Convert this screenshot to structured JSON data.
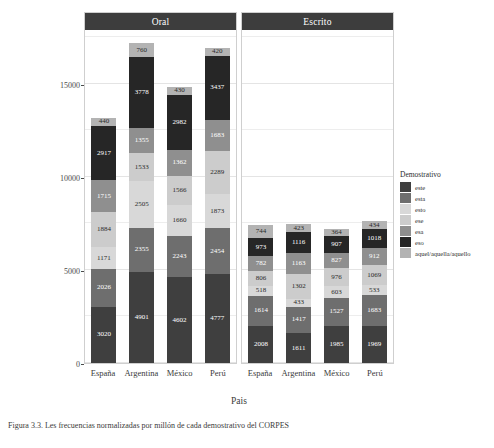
{
  "chart_data": {
    "type": "bar",
    "subtype": "stacked",
    "title": "",
    "xlabel": "Pais",
    "ylabel": "Frecuencia Normalizada por Millón",
    "ylim": [
      0,
      18000
    ],
    "yticks": [
      0,
      5000,
      10000,
      15000
    ],
    "ytick_labels": [
      "0",
      "5000",
      "10000",
      "15000"
    ],
    "grid": true,
    "legend_title": "Demostrativo",
    "legend_position": "right",
    "facets": [
      "Oral",
      "Escrito"
    ],
    "categories": [
      "España",
      "Argentina",
      "México",
      "Perú"
    ],
    "series": [
      {
        "name": "este",
        "color": "#3f3f3f",
        "values_oral": [
          3020,
          4901,
          4602,
          4777
        ],
        "values_escrito": [
          2008,
          1611,
          1985,
          1969
        ]
      },
      {
        "name": "esta",
        "color": "#6e6e6e",
        "values_oral": [
          2026,
          2355,
          2243,
          2454
        ],
        "values_escrito": [
          1614,
          1417,
          1527,
          1683
        ]
      },
      {
        "name": "esto",
        "color": "#d8d8d8",
        "values_oral": [
          1171,
          2505,
          1660,
          1873
        ],
        "values_escrito": [
          518,
          433,
          603,
          533
        ]
      },
      {
        "name": "ese",
        "color": "#cccccc",
        "values_oral": [
          1884,
          1533,
          1566,
          2289
        ],
        "values_escrito": [
          806,
          1302,
          976,
          1069
        ]
      },
      {
        "name": "esa",
        "color": "#8f8f8f",
        "values_oral": [
          1715,
          1355,
          1362,
          1683
        ],
        "values_escrito": [
          782,
          1163,
          827,
          912
        ]
      },
      {
        "name": "eso",
        "color": "#262626",
        "values_oral": [
          2917,
          3778,
          2982,
          3437
        ],
        "values_escrito": [
          973,
          1116,
          907,
          1018
        ]
      },
      {
        "name": "aquel/aquella/aquello",
        "color": "#b3b3b3",
        "values_oral": [
          440,
          760,
          430,
          420
        ],
        "values_escrito": [
          744,
          423,
          364,
          434
        ]
      }
    ]
  },
  "axis": {
    "y_title_lines": [
      "Frecuencia",
      "Normalizada",
      "por Millón"
    ],
    "x_title": "Pais"
  },
  "legend": {
    "title": "Demostrativo",
    "items": [
      {
        "label": "este",
        "color": "#3f3f3f"
      },
      {
        "label": "esta",
        "color": "#6e6e6e"
      },
      {
        "label": "esto",
        "color": "#d8d8d8"
      },
      {
        "label": "ese",
        "color": "#cccccc"
      },
      {
        "label": "esa",
        "color": "#8f8f8f"
      },
      {
        "label": "eso",
        "color": "#262626"
      },
      {
        "label": "aquel/aquella/aquello",
        "color": "#b3b3b3"
      }
    ]
  },
  "caption": "Figura 3.3. Les frecuencias normalizadas por millón de cada demostrativo del CORPES"
}
